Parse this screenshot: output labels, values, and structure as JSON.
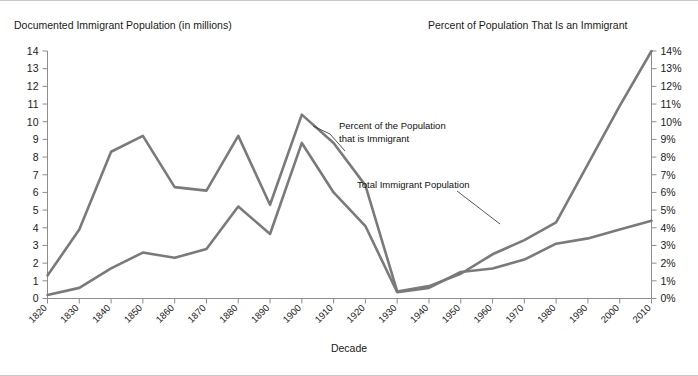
{
  "titles": {
    "left": "Documented Immigrant Population (in millions)",
    "right": "Percent of Population That Is an Immigrant",
    "xaxis": "Decade"
  },
  "annotations": {
    "percent_line1": "Percent of the Population",
    "percent_line2": "that is Immigrant",
    "population": "Total Immigrant Population"
  },
  "colors": {
    "line": "#7a7a7a",
    "axis": "#8d8d8d",
    "text": "#1a1a1a",
    "background": "#ffffff",
    "border": "#c9c9c9"
  },
  "axes": {
    "left_ticks": [
      "0",
      "1",
      "2",
      "3",
      "4",
      "5",
      "6",
      "7",
      "8",
      "9",
      "10",
      "11",
      "12",
      "13",
      "14"
    ],
    "right_ticks": [
      "0%",
      "1%",
      "2%",
      "3%",
      "4%",
      "5%",
      "6%",
      "7%",
      "8%",
      "9%",
      "10%",
      "11%",
      "12%",
      "13%",
      "14%"
    ],
    "x_ticks": [
      "1820",
      "1830",
      "1840",
      "1850",
      "1860",
      "1870",
      "1880",
      "1890",
      "1900",
      "1910",
      "1920",
      "1930",
      "1940",
      "1950",
      "1960",
      "1970",
      "1980",
      "1990",
      "2000",
      "2010"
    ]
  },
  "chart_data": {
    "type": "line",
    "xlabel": "Decade",
    "ylabel": "Documented Immigrant Population (in millions)",
    "y2label": "Percent of Population That Is an Immigrant",
    "ylim": [
      0,
      14
    ],
    "y2lim": [
      0,
      14
    ],
    "grid": false,
    "legend": "annotations-inline",
    "categories": [
      "1820",
      "1830",
      "1840",
      "1850",
      "1860",
      "1870",
      "1880",
      "1890",
      "1900",
      "1910",
      "1920",
      "1930",
      "1940",
      "1950",
      "1960",
      "1970",
      "1980",
      "1990",
      "2000",
      "2010"
    ],
    "series": [
      {
        "name": "Percent of the Population that is Immigrant",
        "axis": "right",
        "unit": "%",
        "values": [
          1.3,
          3.9,
          8.3,
          9.2,
          6.3,
          6.1,
          9.2,
          5.3,
          10.4,
          8.8,
          6.4,
          0.4,
          0.7,
          1.4,
          2.5,
          3.3,
          4.3,
          7.6,
          10.9,
          14.0
        ]
      },
      {
        "name": "Total Immigrant Population",
        "axis": "left",
        "unit": "millions",
        "values": [
          0.2,
          0.6,
          1.7,
          2.6,
          2.3,
          2.8,
          5.2,
          3.65,
          8.8,
          6.0,
          4.1,
          0.35,
          0.6,
          1.5,
          1.7,
          2.2,
          3.1,
          3.4,
          3.9,
          4.4
        ]
      }
    ]
  }
}
